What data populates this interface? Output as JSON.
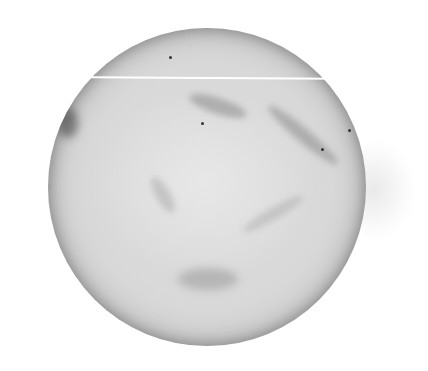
{
  "image": {
    "subject": "bowl of mashed potatoes viewed from above",
    "palette": {
      "background": "#ffffff",
      "center": "#dedede",
      "mid": "#c6c6c6",
      "rim": "#5f5f5f",
      "streak": "#ffffff"
    }
  }
}
